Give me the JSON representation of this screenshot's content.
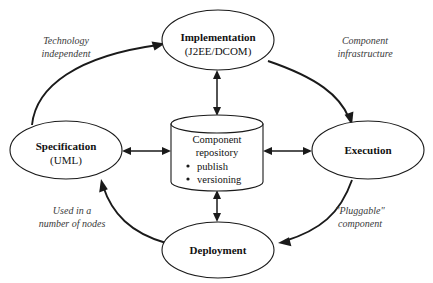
{
  "diagram": {
    "background_color": "#ffffff",
    "line_color": "#1a1a1a",
    "label_color": "#3a3a3a",
    "nodes": [
      {
        "id": "implementation",
        "title": "Implementation",
        "subtitle": "(J2EE/DCOM)",
        "shape": "ellipse",
        "cx": 218,
        "cy": 40,
        "rx": 56,
        "ry": 30
      },
      {
        "id": "specification",
        "title": "Specification",
        "subtitle": "(UML)",
        "shape": "ellipse",
        "cx": 66,
        "cy": 150,
        "rx": 56,
        "ry": 29
      },
      {
        "id": "execution",
        "title": "Execution",
        "subtitle": "",
        "shape": "ellipse",
        "cx": 368,
        "cy": 150,
        "rx": 56,
        "ry": 29
      },
      {
        "id": "deployment",
        "title": "Deployment",
        "subtitle": "",
        "shape": "ellipse",
        "cx": 218,
        "cy": 250,
        "rx": 56,
        "ry": 28
      }
    ],
    "repository": {
      "id": "component-repository",
      "shape": "cylinder",
      "line1": "Component",
      "line2": "repository",
      "bullets": [
        "publish",
        "versioning"
      ],
      "x": 171,
      "y": 115,
      "width": 92,
      "height": 76
    },
    "edge_labels": [
      {
        "id": "technology-independent",
        "line1": "Technology",
        "line2": "independent",
        "x": 66,
        "y": 49
      },
      {
        "id": "component-infrastructure",
        "line1": "Component",
        "line2": "infrastructure",
        "x": 365,
        "y": 49
      },
      {
        "id": "used-in-a-number-of-nodes",
        "line1": "Used in a",
        "line2": "number of nodes",
        "x": 72,
        "y": 219
      },
      {
        "id": "pluggable-component",
        "line1": "\"Pluggable\"",
        "line2": "component",
        "x": 360,
        "y": 219
      }
    ],
    "cycle_arrows": [
      {
        "id": "specification-to-implementation",
        "from": "specification",
        "to": "implementation"
      },
      {
        "id": "implementation-to-execution",
        "from": "implementation",
        "to": "execution"
      },
      {
        "id": "execution-to-deployment",
        "from": "execution",
        "to": "deployment"
      },
      {
        "id": "deployment-to-specification",
        "from": "deployment",
        "to": "specification"
      }
    ],
    "repository_arrows": [
      {
        "id": "repository-implementation",
        "node": "implementation",
        "direction": "bidirectional"
      },
      {
        "id": "repository-specification",
        "node": "specification",
        "direction": "bidirectional"
      },
      {
        "id": "repository-execution",
        "node": "execution",
        "direction": "bidirectional"
      },
      {
        "id": "repository-deployment",
        "node": "deployment",
        "direction": "bidirectional"
      }
    ]
  }
}
